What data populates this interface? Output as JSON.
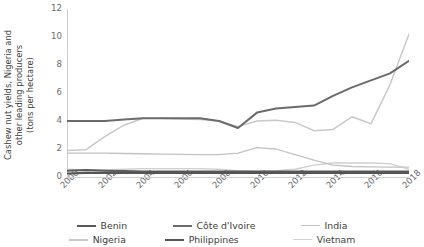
{
  "chart_data": {
    "type": "line",
    "title": "",
    "xlabel": "",
    "ylabel": "Cashew nut yields, Nigeria and other leading producers (tons per hectare)",
    "ylabel_lines": [
      "Cashew nut yields, Nigeria and",
      "other leading producers",
      "(tons per hectare)"
    ],
    "xlim": [
      2000,
      2018
    ],
    "ylim": [
      0,
      12
    ],
    "yticks": [
      0,
      2,
      4,
      6,
      8,
      10,
      12
    ],
    "xticks": [
      2000,
      2002,
      2004,
      2006,
      2008,
      2010,
      2012,
      2014,
      2016,
      2018
    ],
    "grid": false,
    "legend_position": "bottom",
    "x": [
      2000,
      2001,
      2002,
      2003,
      2004,
      2005,
      2006,
      2007,
      2008,
      2009,
      2010,
      2011,
      2012,
      2013,
      2014,
      2015,
      2016,
      2017,
      2018
    ],
    "series": [
      {
        "name": "Benin",
        "color": "#5a5a5a",
        "width": 2.0,
        "values": [
          0.45,
          0.5,
          0.45,
          0.42,
          0.4,
          0.4,
          0.4,
          0.4,
          0.4,
          0.4,
          0.4,
          0.4,
          0.4,
          0.4,
          0.4,
          0.4,
          0.4,
          0.4,
          0.4
        ]
      },
      {
        "name": "Côte d'Ivoire",
        "color": "#6b6b6b",
        "width": 2.0,
        "values": [
          4.0,
          4.0,
          4.0,
          4.1,
          4.2,
          4.2,
          4.2,
          4.2,
          4.0,
          3.5,
          4.6,
          4.9,
          5.0,
          5.1,
          5.8,
          6.4,
          6.9,
          7.4,
          8.3
        ]
      },
      {
        "name": "India",
        "color": "#c2c2c2",
        "width": 1.3,
        "values": [
          1.7,
          1.7,
          1.7,
          1.68,
          1.66,
          1.64,
          1.62,
          1.6,
          1.6,
          1.7,
          2.1,
          2.0,
          1.6,
          1.2,
          0.85,
          0.75,
          0.72,
          0.7,
          0.7
        ]
      },
      {
        "name": "Nigeria",
        "color": "#c9c9c9",
        "width": 1.5,
        "values": [
          1.9,
          1.95,
          2.9,
          3.7,
          4.2,
          4.2,
          4.15,
          4.1,
          4.0,
          3.6,
          4.0,
          4.05,
          3.9,
          3.3,
          3.4,
          4.3,
          3.8,
          6.6,
          10.2
        ]
      },
      {
        "name": "Philippines",
        "color": "#555555",
        "width": 2.2,
        "values": [
          0.25,
          0.3,
          0.3,
          0.3,
          0.3,
          0.3,
          0.3,
          0.3,
          0.3,
          0.3,
          0.3,
          0.3,
          0.3,
          0.3,
          0.3,
          0.3,
          0.3,
          0.3,
          0.3
        ]
      },
      {
        "name": "Vietnam",
        "color": "#d0d0d0",
        "width": 1.4,
        "values": [
          0.55,
          0.5,
          0.5,
          0.55,
          0.6,
          0.6,
          0.6,
          0.6,
          0.55,
          0.45,
          0.4,
          0.45,
          0.55,
          0.85,
          1.0,
          1.0,
          1.0,
          0.95,
          0.55
        ]
      }
    ]
  },
  "legend": {
    "rows": [
      [
        {
          "label": "Benin",
          "series": "Benin"
        },
        {
          "label": "Côte d'Ivoire",
          "series": "Côte d'Ivoire"
        },
        {
          "label": "India",
          "series": "India"
        }
      ],
      [
        {
          "label": "Nigeria",
          "series": "Nigeria"
        },
        {
          "label": "Philippines",
          "series": "Philippines"
        },
        {
          "label": "Vietnam",
          "series": "Vietnam"
        }
      ]
    ]
  },
  "axis_style": {
    "spine_color": "#cfcfcf",
    "tick_color": "#cfcfcf",
    "label_color": "#6b6b6b"
  }
}
